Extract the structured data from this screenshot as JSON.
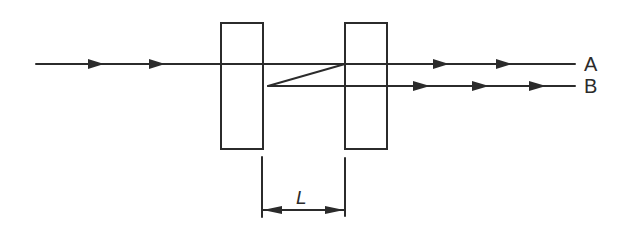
{
  "diagram": {
    "type": "optical-beam-path",
    "stroke_color": "#2b2b2b",
    "background_color": "#ffffff",
    "incoming_beam": {
      "arrow_count": 2
    },
    "elements": [
      {
        "name": "plate-1"
      },
      {
        "name": "plate-2"
      }
    ],
    "outputs": [
      {
        "label": "A",
        "arrow_count": 2
      },
      {
        "label": "B",
        "arrow_count": 3
      }
    ],
    "dimension": {
      "label": "L",
      "description": "separation between plates"
    }
  }
}
